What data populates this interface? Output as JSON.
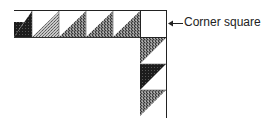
{
  "diagram": {
    "annotation": {
      "label": "Corner square",
      "arrow": "left-arrow"
    },
    "top_row": {
      "blocks": [
        {
          "type": "half-square-triangle",
          "fill": "dark",
          "color": "#1a1a1a"
        },
        {
          "type": "half-square-triangle",
          "fill": "light-stipple",
          "color": "#a8a8a8"
        },
        {
          "type": "half-square-triangle",
          "fill": "medium-stipple",
          "color": "#6e6e6e"
        },
        {
          "type": "half-square-triangle",
          "fill": "medium-stipple",
          "color": "#6e6e6e"
        },
        {
          "type": "half-square-triangle",
          "fill": "medium-stipple",
          "color": "#6e6e6e"
        }
      ]
    },
    "corner": {
      "type": "plain-square",
      "fill": "white"
    },
    "side_column": {
      "blocks": [
        {
          "type": "half-square-triangle",
          "fill": "medium-stipple",
          "color": "#8a8a8a"
        },
        {
          "type": "half-square-triangle",
          "fill": "dark",
          "color": "#1a1a1a"
        },
        {
          "type": "half-square-triangle",
          "fill": "medium-stipple",
          "color": "#8a8a8a"
        }
      ]
    }
  }
}
